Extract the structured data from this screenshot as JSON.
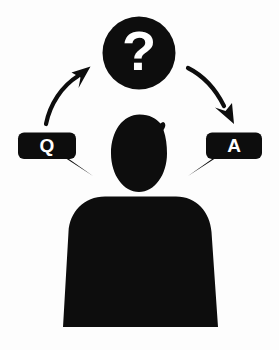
{
  "figure": {
    "background_color": "#fdfdfd",
    "ink_color": "#0d0d0d",
    "text_color": "#ffffff"
  },
  "thought_bubble": {
    "name": "question-mark-circle",
    "symbol": "?",
    "shape": "circle",
    "center_x": 139,
    "center_y": 53,
    "radius": 36,
    "fill": "#0d0d0d"
  },
  "question_bubble": {
    "name": "q-speech-bubble",
    "label": "Q",
    "x": 18,
    "y": 133,
    "width": 58,
    "height": 26,
    "tail_direction": "right-down",
    "fill": "#0d0d0d"
  },
  "answer_bubble": {
    "name": "a-speech-bubble",
    "label": "A",
    "x": 206,
    "y": 133,
    "width": 56,
    "height": 26,
    "tail_direction": "left-down",
    "fill": "#0d0d0d"
  },
  "arrow_in": {
    "name": "arrow-question-to-head",
    "direction": "up-right",
    "from": "q-speech-bubble",
    "to": "question-mark-circle"
  },
  "arrow_out": {
    "name": "arrow-head-to-answer",
    "direction": "down-right",
    "from": "question-mark-circle",
    "to": "a-speech-bubble"
  },
  "person": {
    "name": "person-silhouette",
    "head": {
      "center_x": 139,
      "center_y": 153,
      "radius_x": 27,
      "radius_y": 38
    },
    "body": {
      "top_y": 196,
      "bottom_y": 327,
      "top_left_x": 68,
      "top_right_x": 211,
      "bottom_left_x": 63,
      "bottom_right_x": 218
    },
    "fill": "#0d0d0d"
  }
}
